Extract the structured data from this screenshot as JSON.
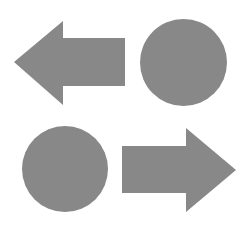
{
  "canvas": {
    "width": 250,
    "height": 231,
    "background_color": "#ffffff",
    "description": "Four gray geometric shapes arranged in a two-by-two grid"
  },
  "palette": {
    "shape_fill": "#888888",
    "background": "#ffffff"
  },
  "shapes": [
    {
      "id": "arrow-left",
      "label": "Left-pointing arrow",
      "type": "arrow",
      "direction": "left",
      "fill": "#888888",
      "grid_position": "top-left",
      "bounds": {
        "x": 14,
        "y": 20,
        "width": 111,
        "height": 86
      },
      "points": "14,62 63,21 63,38 125,38 125,86 63,86 63,105"
    },
    {
      "id": "circle-top-right",
      "label": "Circle",
      "type": "circle",
      "fill": "#888888",
      "grid_position": "top-right",
      "bounds": {
        "x": 140,
        "y": 19,
        "width": 87,
        "height": 87
      },
      "center": {
        "cx": 183.5,
        "cy": 62.5
      },
      "radius": 43.5
    },
    {
      "id": "circle-bottom-left",
      "label": "Circle",
      "type": "circle",
      "fill": "#888888",
      "grid_position": "bottom-left",
      "bounds": {
        "x": 22,
        "y": 126,
        "width": 86,
        "height": 86
      },
      "center": {
        "cx": 65,
        "cy": 169
      },
      "radius": 43
    },
    {
      "id": "arrow-right",
      "label": "Right-pointing arrow",
      "type": "arrow",
      "direction": "right",
      "fill": "#888888",
      "grid_position": "bottom-right",
      "bounds": {
        "x": 122,
        "y": 128,
        "width": 114,
        "height": 84
      },
      "points": "236,170 186,128 186,146 122,146 122,193 186,193 186,212"
    }
  ]
}
